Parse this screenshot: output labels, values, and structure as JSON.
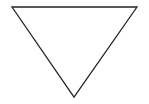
{
  "diagram": {
    "shape": "inverted-triangle",
    "stroke_color": "#222222",
    "fill_color": "#ffffff",
    "stroke_width": 1.3,
    "vertices": {
      "top_left": [
        12,
        7
      ],
      "top_right": [
        137,
        7
      ],
      "bottom": [
        74,
        97
      ]
    }
  }
}
